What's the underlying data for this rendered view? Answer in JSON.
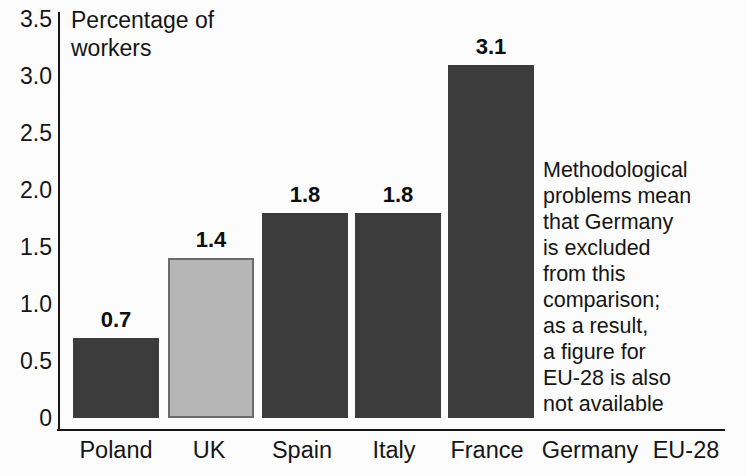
{
  "chart_data": {
    "type": "bar",
    "title": "Percentage of workers",
    "categories": [
      "Poland",
      "UK",
      "Spain",
      "Italy",
      "France",
      "Germany",
      "EU-28"
    ],
    "values": [
      0.7,
      1.4,
      1.8,
      1.8,
      3.1,
      null,
      null
    ],
    "bar_shades": [
      "dark",
      "light",
      "dark",
      "dark",
      "dark",
      null,
      null
    ],
    "value_labels": [
      "0.7",
      "1.4",
      "1.8",
      "1.8",
      "3.1",
      null,
      null
    ],
    "xlabel": "",
    "ylabel": "Percentage of workers",
    "ylim": [
      0,
      3.5
    ],
    "yticks": [
      "0",
      "0.5",
      "1.0",
      "1.5",
      "2.0",
      "2.5",
      "3.0",
      "3.5"
    ],
    "grid": false,
    "legend": null,
    "annotation": "Methodological\nproblems mean\nthat Germany\nis excluded\nfrom this\ncomparison;\nas a result,\na figure for\nEU-28 is also\nnot available"
  },
  "colors": {
    "bar_dark": "#3c3c3c",
    "bar_light_fill": "#b6b6b6",
    "bar_light_border": "#6b6b6b",
    "axis": "#161616",
    "text": "#151515",
    "background": "#fcfcfc"
  }
}
